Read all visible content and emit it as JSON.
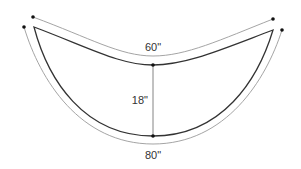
{
  "diagram": {
    "type": "crescent-shape-dimension-drawing",
    "colors": {
      "shape_stroke": "#333333",
      "dimension_stroke": "#9a9a9a",
      "dots": "#111111",
      "text": "#333333"
    },
    "dimensions": {
      "top_arc": {
        "label": "60\""
      },
      "depth": {
        "label": "18\""
      },
      "bottom_arc": {
        "label": "80\""
      }
    }
  }
}
